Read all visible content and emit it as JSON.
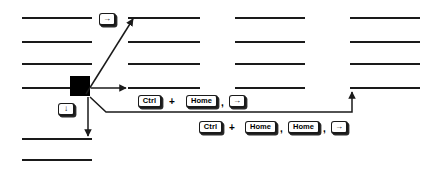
{
  "page": {
    "background_color": "#ffffff",
    "ink_color": "#1a1a1a",
    "width": 435,
    "height": 172
  },
  "text_lines": {
    "description": "Rows of short horizontal rules standing in for lines of text",
    "columns": [
      {
        "name": "column-1",
        "x": 22,
        "width": 70
      },
      {
        "name": "column-2",
        "x": 128,
        "width": 72
      },
      {
        "name": "column-3",
        "x": 235,
        "width": 70
      },
      {
        "name": "column-4",
        "x": 350,
        "width": 70
      }
    ],
    "rows": [
      {
        "name": "row-1",
        "y": 18
      },
      {
        "name": "row-2",
        "y": 42
      },
      {
        "name": "row-3",
        "y": 64
      },
      {
        "name": "row-4",
        "y": 88
      }
    ],
    "extra_lines": [
      {
        "name": "bottom-line-1",
        "x": 22,
        "y": 139,
        "width": 70
      },
      {
        "name": "bottom-line-2",
        "x": 22,
        "y": 160,
        "width": 70
      }
    ]
  },
  "cursor_block": {
    "name": "cursor-block",
    "x": 70,
    "y": 76,
    "width": 20,
    "height": 20,
    "color": "#000000"
  },
  "callout_keys": [
    {
      "name": "key-arrow-right-top",
      "glyph": "→",
      "label": "Right Arrow",
      "x": 99,
      "y": 13,
      "width": 17,
      "height": 13
    },
    {
      "name": "key-arrow-down-left",
      "glyph": "↓",
      "label": "Down Arrow",
      "x": 58,
      "y": 103,
      "width": 17,
      "height": 13
    }
  ],
  "sequences": [
    {
      "name": "shortcut-sequence-1",
      "items": [
        {
          "type": "key",
          "label": "Ctrl",
          "name": "key-ctrl"
        },
        {
          "type": "operator",
          "label": "+",
          "name": "plus-operator"
        },
        {
          "type": "key",
          "label": "Home",
          "name": "key-home"
        },
        {
          "type": "separator",
          "label": ",",
          "name": "comma-separator"
        },
        {
          "type": "key",
          "label": "→",
          "name": "key-arrow-right"
        }
      ],
      "plain_text": "Ctrl + Home , →"
    },
    {
      "name": "shortcut-sequence-2",
      "items": [
        {
          "type": "key",
          "label": "Ctrl",
          "name": "key-ctrl"
        },
        {
          "type": "operator",
          "label": "+",
          "name": "plus-operator"
        },
        {
          "type": "key",
          "label": "Home",
          "name": "key-home"
        },
        {
          "type": "separator",
          "label": ",",
          "name": "comma-separator"
        },
        {
          "type": "key",
          "label": "Home",
          "name": "key-home-2"
        },
        {
          "type": "separator",
          "label": ",",
          "name": "comma-separator-2"
        },
        {
          "type": "key",
          "label": "→",
          "name": "key-arrow-right"
        }
      ],
      "plain_text": "Ctrl + Home , Home , →"
    }
  ],
  "arrows": [
    {
      "name": "arrow-up-right-to-row1",
      "from": [
        88,
        92
      ],
      "to": [
        133,
        18
      ]
    },
    {
      "name": "arrow-right-to-row4",
      "from": [
        92,
        88
      ],
      "to": [
        126,
        88
      ]
    },
    {
      "name": "arrow-down-to-bottom",
      "from": [
        88,
        96
      ],
      "to": [
        88,
        136
      ]
    },
    {
      "name": "arrow-elbow-to-column4",
      "path": "90,97 105,112 352,112 352,91"
    }
  ]
}
